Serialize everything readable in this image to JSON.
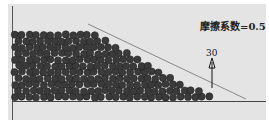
{
  "diagram": {
    "friction_label": "摩擦系数=0.5",
    "angle_label": "30",
    "colors": {
      "background": "#e4e4e4",
      "particle": "#3a3a3a",
      "slope_line": "#888888",
      "ground": "#444444"
    }
  }
}
